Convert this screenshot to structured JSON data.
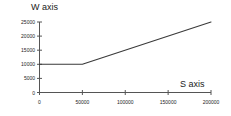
{
  "chart_data": {
    "type": "line",
    "title": "",
    "xlabel": "S axis",
    "ylabel": "W axis",
    "x": [
      0,
      50000,
      200000
    ],
    "values": [
      10000,
      10000,
      25000
    ],
    "series": [
      {
        "name": "W",
        "x": [
          0,
          50000,
          200000
        ],
        "values": [
          10000,
          10000,
          25000
        ]
      }
    ],
    "xlim": [
      0,
      200000
    ],
    "ylim": [
      0,
      25000
    ],
    "xticks": [
      0,
      50000,
      100000,
      150000,
      200000
    ],
    "yticks": [
      0,
      5000,
      10000,
      15000,
      20000,
      25000
    ],
    "xtick_labels": [
      "0",
      "50000",
      "100000",
      "150000",
      "200000"
    ],
    "ytick_labels": [
      "0",
      "5000",
      "10000",
      "15000",
      "20000",
      "25000"
    ],
    "grid": false,
    "legend": false,
    "legend_position": "none",
    "line_color": "#3a3a3a",
    "axis_color": "#555555",
    "background_color": "#ffffff"
  },
  "axes": {
    "y_title": "W axis",
    "x_title": "S axis"
  }
}
